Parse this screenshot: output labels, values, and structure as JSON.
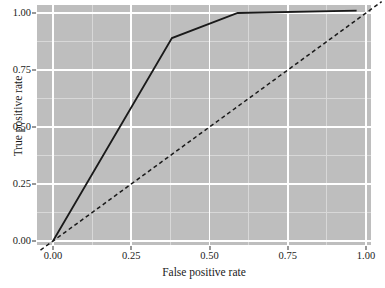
{
  "chart_data": {
    "type": "line",
    "title": "",
    "xlabel": "False positive rate",
    "ylabel": "True positive rate",
    "xlim": [
      0.0,
      1.0
    ],
    "ylim": [
      0.0,
      1.0
    ],
    "x_ticks": [
      0.0,
      0.25,
      0.5,
      0.75,
      1.0
    ],
    "y_ticks": [
      0.0,
      0.25,
      0.5,
      0.75,
      1.0
    ],
    "x_tick_labels": [
      "0.00",
      "0.25",
      "0.50",
      "0.75",
      "1.00"
    ],
    "y_tick_labels": [
      "0.00",
      "0.25",
      "0.50",
      "0.75",
      "1.00"
    ],
    "grid": true,
    "grid_major_color": "#ffffff",
    "grid_minor_color": "#d8d8d8",
    "panel_background": "#bebebe",
    "legend": "none",
    "series": [
      {
        "name": "ROC curve",
        "style": "solid",
        "color": "#1a1a1a",
        "width": 1.8,
        "x": [
          0.0,
          0.38,
          0.59,
          0.97
        ],
        "y": [
          0.0,
          0.89,
          1.0,
          1.01
        ]
      },
      {
        "name": "Chance diagonal",
        "style": "dashed",
        "color": "#1a1a1a",
        "width": 1.5,
        "x": [
          -0.04,
          1.05
        ],
        "y": [
          -0.04,
          1.05
        ]
      }
    ]
  },
  "axes": {
    "x_title": "False positive rate",
    "y_title": "True positive rate"
  }
}
